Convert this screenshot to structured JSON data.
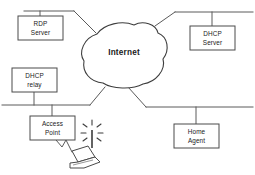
{
  "diagram": {
    "background_color": "#ffffff",
    "line_color": "#5a5a5a",
    "box_stroke_color": "#4a4a4a",
    "text_color": "#1a1a1a",
    "cloud": {
      "label": "Internet",
      "name": "internet-cloud"
    },
    "nodes": [
      {
        "name": "rdp-server",
        "line1": "RDP",
        "line2": "Server"
      },
      {
        "name": "dhcp-server",
        "line1": "DHCP",
        "line2": "Server"
      },
      {
        "name": "dhcp-relay",
        "line1": "DHCP",
        "line2": "relay"
      },
      {
        "name": "access-point",
        "line1": "Access",
        "line2": "Point"
      },
      {
        "name": "home-agent",
        "line1": "Home",
        "line2": "Agent"
      }
    ],
    "devices": [
      {
        "name": "wireless-laptop",
        "type": "laptop-with-antenna"
      }
    ]
  }
}
